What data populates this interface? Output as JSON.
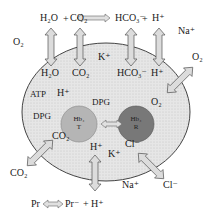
{
  "diagram": {
    "type": "red-blood-cell-transport",
    "colors": {
      "cell_fill": "#e4e4e4",
      "cell_stroke": "#444444",
      "hb_t_fill": "#b3b3b3",
      "hb_r_fill": "#7a7a7a",
      "arrow_fill": "#d9d9d9",
      "arrow_stroke": "#555555"
    },
    "top_reaction": {
      "h2o": "H₂O",
      "plus1": "+",
      "co2": "CO₂",
      "hco3": "HCO₃⁻",
      "plus2": "+",
      "h": "H⁺"
    },
    "inner_reaction": {
      "h2o": "H₂O",
      "co2": "CO₂",
      "hco3": "HCO₃⁻",
      "h": "H⁺"
    },
    "outside": {
      "o2_left": "O₂",
      "na_top_right": "Na⁺",
      "o2_right": "O₂",
      "co2_left": "CO₂",
      "na_bottom": "Na⁺",
      "cl_right": "Cl⁻"
    },
    "inside": {
      "k_top": "K⁺",
      "atp": "ATP",
      "h_left": "H⁺",
      "dpg_top": "DPG",
      "dpg_left": "DPG",
      "o2": "O₂",
      "co2": "CO₂",
      "h_bottom": "H⁺",
      "k_bottom": "K⁺",
      "cl": "Cl⁻"
    },
    "hemoglobin": {
      "t_state": {
        "line1": "Hb₄",
        "line2": "T"
      },
      "r_state": {
        "line1": "Hb₄",
        "line2": "R"
      }
    },
    "bottom_reaction": {
      "pr": "Pr",
      "pr_minus": "Pr⁻",
      "plus": "+",
      "h": "H⁺"
    }
  }
}
